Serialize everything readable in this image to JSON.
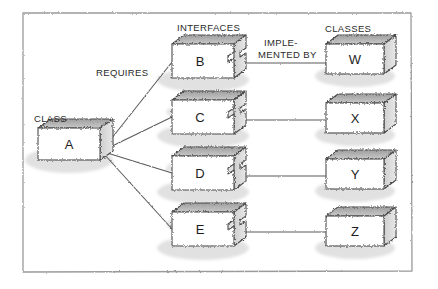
{
  "diagram": {
    "title_labels": {
      "class_label": "CLASS",
      "interfaces_label": "INTERFACES",
      "classes_label": "CLASSES",
      "requires_label": "REQUIRES",
      "implemented_by_line1": "IMPLE-",
      "implemented_by_line2": "MENTED BY"
    },
    "colors": {
      "stroke": "#4a4a4a",
      "text": "#2a2a2a",
      "face_fill": "#ffffff",
      "top_fill": "#b9b9b9",
      "side_fill": "#d8d8d8",
      "frame": "#9a9a9a",
      "background": "#ffffff"
    },
    "class_node": {
      "name": "A",
      "label": "CLASS",
      "x": 38,
      "y": 128,
      "w": 62,
      "h": 32
    },
    "interface_nodes": [
      {
        "name": "B",
        "x": 172,
        "y": 44,
        "w": 62,
        "h": 34
      },
      {
        "name": "C",
        "x": 172,
        "y": 100,
        "w": 62,
        "h": 34
      },
      {
        "name": "D",
        "x": 172,
        "y": 156,
        "w": 62,
        "h": 34
      },
      {
        "name": "E",
        "x": 172,
        "y": 212,
        "w": 62,
        "h": 34
      }
    ],
    "class_nodes": [
      {
        "name": "W",
        "x": 326,
        "y": 44,
        "w": 58,
        "h": 30
      },
      {
        "name": "X",
        "x": 326,
        "y": 103,
        "w": 58,
        "h": 30
      },
      {
        "name": "Y",
        "x": 326,
        "y": 159,
        "w": 58,
        "h": 30
      },
      {
        "name": "Z",
        "x": 326,
        "y": 216,
        "w": 58,
        "h": 30
      }
    ],
    "requires_edges": [
      {
        "from": "A",
        "to": "B"
      },
      {
        "from": "A",
        "to": "C"
      },
      {
        "from": "A",
        "to": "D"
      },
      {
        "from": "A",
        "to": "E"
      }
    ],
    "implemented_by_edges": [
      {
        "from": "B",
        "to": "W"
      },
      {
        "from": "C",
        "to": "X"
      },
      {
        "from": "D",
        "to": "Y"
      },
      {
        "from": "E",
        "to": "Z"
      }
    ],
    "frame": {
      "x": 22,
      "y": 12,
      "w": 390,
      "h": 260
    }
  }
}
